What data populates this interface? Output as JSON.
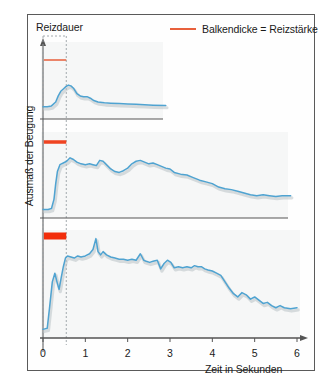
{
  "figure": {
    "legend": {
      "marker_color": "#e8603c",
      "text": "Balkendicke = Reizstärke"
    },
    "stimulus_label": "Reizdauer",
    "y_axis_label": "Ausmaß der Beugung",
    "x_axis_label": "Zeit in Sekunden",
    "curve_color": "#4fa3d1",
    "shadow_color": "#b9c3c7",
    "axis_color": "#555555",
    "frame_color": "#5a5a5a"
  },
  "chart_data": {
    "type": "line",
    "title": "",
    "subtitle": "",
    "xlabel": "Zeit in Sekunden",
    "ylabel": "Ausmaß der Beugung",
    "xlim": [
      0,
      6
    ],
    "x_ticks": [
      0,
      1,
      2,
      3,
      4,
      5,
      6
    ],
    "x_tick_labels": [
      "0",
      "1",
      "2",
      "3",
      "4",
      "5",
      "6"
    ],
    "ylim": [
      0,
      1
    ],
    "y_ticks": [],
    "y_tick_labels": [],
    "grid": false,
    "legend_position": "top-right",
    "annotations": [
      {
        "text": "Reizdauer",
        "x": 0.28,
        "note": "dotted box marking stimulus duration 0 to 0.55 s"
      },
      {
        "text": "Balkendicke = Reizstärke",
        "note": "bar thickness encodes stimulus strength"
      }
    ],
    "stimulus_window": {
      "start": 0.0,
      "end": 0.55
    },
    "panels": [
      {
        "name": "panel-weak-stimulus",
        "stimulus_strength": "weak",
        "bar_thickness_px": 1.5,
        "bar_color": "#e8603c",
        "bar_start": 0.02,
        "bar_end": 0.55,
        "x_extent": [
          0,
          2.9
        ],
        "series": [
          {
            "name": "Beugung",
            "x": [
              0.0,
              0.1,
              0.2,
              0.3,
              0.36,
              0.42,
              0.48,
              0.54,
              0.6,
              0.66,
              0.72,
              0.8,
              0.88,
              0.96,
              1.04,
              1.12,
              1.2,
              1.3,
              1.45,
              1.6,
              1.8,
              2.0,
              2.2,
              2.4,
              2.6,
              2.9
            ],
            "y": [
              0.16,
              0.16,
              0.17,
              0.22,
              0.3,
              0.36,
              0.39,
              0.42,
              0.44,
              0.43,
              0.4,
              0.33,
              0.3,
              0.29,
              0.29,
              0.27,
              0.24,
              0.22,
              0.21,
              0.205,
              0.2,
              0.195,
              0.19,
              0.185,
              0.18,
              0.175
            ]
          }
        ]
      },
      {
        "name": "panel-medium-stimulus",
        "stimulus_strength": "medium",
        "bar_thickness_px": 3.5,
        "bar_color": "#ef4422",
        "bar_start": 0.02,
        "bar_end": 0.55,
        "x_extent": [
          0,
          5.85
        ],
        "series": [
          {
            "name": "Beugung",
            "x": [
              0.0,
              0.12,
              0.2,
              0.26,
              0.3,
              0.34,
              0.4,
              0.48,
              0.56,
              0.64,
              0.72,
              0.8,
              0.9,
              1.0,
              1.1,
              1.18,
              1.26,
              1.34,
              1.42,
              1.5,
              1.6,
              1.7,
              1.8,
              1.9,
              2.0,
              2.1,
              2.2,
              2.3,
              2.4,
              2.5,
              2.6,
              2.7,
              2.8,
              2.9,
              3.0,
              3.1,
              3.25,
              3.4,
              3.55,
              3.7,
              3.85,
              4.0,
              4.15,
              4.3,
              4.45,
              4.6,
              4.75,
              4.9,
              5.05,
              5.2,
              5.35,
              5.5,
              5.65,
              5.85
            ],
            "y": [
              0.1,
              0.1,
              0.11,
              0.22,
              0.4,
              0.54,
              0.62,
              0.64,
              0.66,
              0.7,
              0.68,
              0.65,
              0.63,
              0.62,
              0.63,
              0.62,
              0.61,
              0.67,
              0.66,
              0.62,
              0.57,
              0.54,
              0.53,
              0.55,
              0.58,
              0.63,
              0.66,
              0.67,
              0.65,
              0.63,
              0.64,
              0.62,
              0.6,
              0.58,
              0.57,
              0.53,
              0.51,
              0.5,
              0.47,
              0.44,
              0.42,
              0.4,
              0.36,
              0.34,
              0.33,
              0.31,
              0.29,
              0.27,
              0.26,
              0.27,
              0.26,
              0.25,
              0.26,
              0.26
            ]
          }
        ]
      },
      {
        "name": "panel-strong-stimulus",
        "stimulus_strength": "strong",
        "bar_thickness_px": 7,
        "bar_color": "#f22d0a",
        "bar_start": 0.02,
        "bar_end": 0.55,
        "x_extent": [
          0,
          6.0
        ],
        "series": [
          {
            "name": "Beugung",
            "x": [
              0.0,
              0.1,
              0.16,
              0.22,
              0.28,
              0.33,
              0.38,
              0.43,
              0.48,
              0.53,
              0.58,
              0.66,
              0.74,
              0.82,
              0.9,
              1.0,
              1.1,
              1.18,
              1.25,
              1.3,
              1.36,
              1.42,
              1.5,
              1.6,
              1.7,
              1.8,
              1.9,
              2.0,
              2.1,
              2.2,
              2.3,
              2.38,
              2.44,
              2.52,
              2.6,
              2.7,
              2.78,
              2.86,
              2.94,
              3.02,
              3.1,
              3.2,
              3.3,
              3.4,
              3.5,
              3.58,
              3.66,
              3.74,
              3.82,
              3.9,
              4.0,
              4.1,
              4.2,
              4.3,
              4.4,
              4.5,
              4.6,
              4.7,
              4.8,
              4.9,
              5.0,
              5.1,
              5.2,
              5.3,
              5.4,
              5.5,
              5.6,
              5.7,
              5.85,
              6.0
            ],
            "y": [
              0.08,
              0.09,
              0.3,
              0.52,
              0.6,
              0.52,
              0.45,
              0.56,
              0.66,
              0.74,
              0.76,
              0.75,
              0.74,
              0.76,
              0.75,
              0.76,
              0.78,
              0.82,
              0.92,
              0.8,
              0.77,
              0.8,
              0.77,
              0.75,
              0.74,
              0.73,
              0.73,
              0.72,
              0.73,
              0.72,
              0.78,
              0.72,
              0.71,
              0.7,
              0.71,
              0.72,
              0.64,
              0.69,
              0.72,
              0.7,
              0.65,
              0.66,
              0.65,
              0.66,
              0.65,
              0.67,
              0.66,
              0.66,
              0.64,
              0.63,
              0.62,
              0.6,
              0.58,
              0.52,
              0.46,
              0.41,
              0.38,
              0.42,
              0.4,
              0.36,
              0.38,
              0.35,
              0.32,
              0.33,
              0.3,
              0.28,
              0.3,
              0.28,
              0.27,
              0.28
            ]
          }
        ]
      }
    ]
  }
}
